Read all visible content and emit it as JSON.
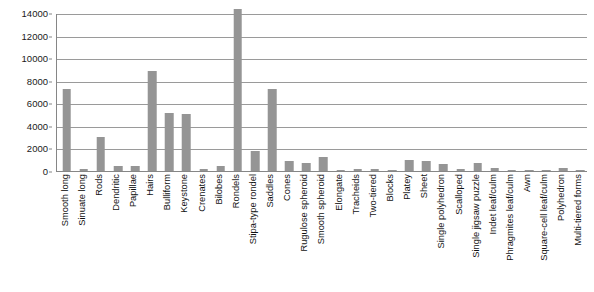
{
  "chart_data": {
    "type": "bar",
    "title": "",
    "subtitle": "",
    "xlabel": "",
    "ylabel": "",
    "ylim": [
      0,
      14000
    ],
    "yticks": [
      0,
      2000,
      4000,
      6000,
      8000,
      10000,
      12000,
      14000
    ],
    "ytick_labels": [
      "0",
      "2000",
      "4000",
      "6000",
      "8000",
      "10000",
      "12000",
      "14000"
    ],
    "grid": true,
    "legend": false,
    "legend_position": "none",
    "bar_color": "#959595",
    "gridline_color": "#9a9a9a",
    "axis_color": "#868686",
    "categories": [
      "Smooth long",
      "Sinuate long",
      "Rods",
      "Dendritic",
      "Papillae",
      "Hairs",
      "Bulliform",
      "Keystone",
      "Crenates",
      "Bilobes",
      "Rondels",
      "Stipa-type rondel",
      "Saddles",
      "Cones",
      "Rugulose spheroid",
      "Smooth spheroid",
      "Elongate",
      "Tracheids",
      "Two-tiered",
      "Blocks",
      "Platey",
      "Sheet",
      "Single polyhedron",
      "Scalloped",
      "Single jigsaw puzzle",
      "Indet leaf/culm",
      "Phragmites leaf/culm",
      "Awn",
      "Square-cell leaf/culm",
      "Polyhedron",
      "Multi-tiered forms"
    ],
    "values": [
      7300,
      180,
      3050,
      420,
      440,
      8900,
      5100,
      5050,
      170,
      450,
      14400,
      1800,
      7300,
      880,
      700,
      1250,
      95,
      200,
      170,
      130,
      1020,
      900,
      640,
      210,
      700,
      300,
      60,
      55,
      50,
      260,
      40
    ]
  }
}
